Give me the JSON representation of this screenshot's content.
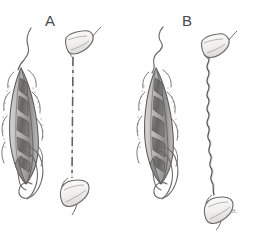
{
  "figure": {
    "width": 253,
    "height": 231,
    "background_color": "#ffffff",
    "medium": "graphite pencil drawing",
    "artist_mark": "B."
  },
  "panels": [
    {
      "id": "A",
      "label": "A",
      "label_x": 45,
      "label_y": 13,
      "organism": {
        "name": "elongated-segmented-body",
        "origin_x": 8,
        "origin_y": 55,
        "tip_y": 62,
        "base_y": 185,
        "outline_color": "#6e6e6e",
        "body_fill": "#b9b8b6",
        "segment_fill": "#6b6a68",
        "segment_count": 6,
        "has_apical_flagellum": true,
        "has_lateral_bristles": true,
        "has_posterior_loops": true
      },
      "strand": {
        "name": "straight-dashed-strand",
        "style": "dashed",
        "x": 73,
        "top_y": 57,
        "bottom_y": 178,
        "color": "#4f4f4f",
        "dash_pattern": "9 4 3 4"
      },
      "bands": [
        {
          "name": "upper-band",
          "cx": 79,
          "cy": 45,
          "rotation": -28
        },
        {
          "name": "lower-band",
          "cx": 75,
          "cy": 192,
          "rotation": -38
        }
      ]
    },
    {
      "id": "B",
      "label": "B",
      "label_x": 182,
      "label_y": 13,
      "organism": {
        "name": "elongated-segmented-body",
        "origin_x": 145,
        "origin_y": 55,
        "tip_y": 62,
        "base_y": 185,
        "outline_color": "#6e6e6e",
        "body_fill": "#b9b8b6",
        "segment_fill": "#6b6a68",
        "segment_count": 6,
        "has_apical_flagellum": true,
        "has_lateral_bristles": true,
        "has_posterior_loops": true
      },
      "strand": {
        "name": "wavy-sinuous-strand",
        "style": "wavy",
        "x": 208,
        "top_y": 56,
        "bottom_y": 196,
        "color": "#585858",
        "wave_amplitude": 4,
        "wave_count": 16
      },
      "bands": [
        {
          "name": "upper-band",
          "cx": 214,
          "cy": 48,
          "rotation": -22
        },
        {
          "name": "lower-band",
          "cx": 218,
          "cy": 207,
          "rotation": -30
        }
      ]
    }
  ],
  "colors": {
    "ink": "#5a5a5a",
    "ink_dark": "#3c3c3c",
    "fill_light": "#c7c6c4",
    "fill_mid": "#9e9d9b",
    "fill_dark": "#6b6a68",
    "label": "#4a4a4a",
    "paper": "#ffffff"
  }
}
